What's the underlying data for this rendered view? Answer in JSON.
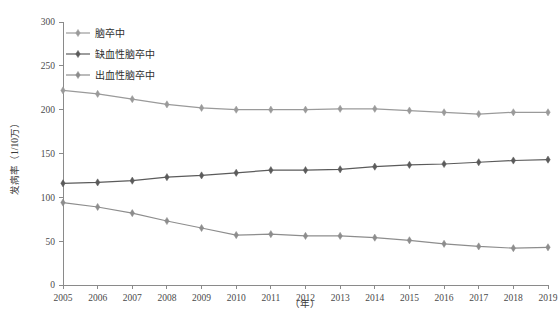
{
  "chart_data": {
    "type": "line",
    "title": "",
    "xlabel": "（年）",
    "ylabel": "发病率（1/10万）",
    "categories": [
      "2005",
      "2006",
      "2007",
      "2008",
      "2009",
      "2010",
      "2011",
      "2012",
      "2013",
      "2014",
      "2015",
      "2016",
      "2017",
      "2018",
      "2019"
    ],
    "x": [
      2005,
      2006,
      2007,
      2008,
      2009,
      2010,
      2011,
      2012,
      2013,
      2014,
      2015,
      2016,
      2017,
      2018,
      2019
    ],
    "xlim": [
      2005,
      2019
    ],
    "ylim": [
      0,
      300
    ],
    "yticks": [
      0,
      50,
      100,
      150,
      200,
      250,
      300
    ],
    "ytick_labels": [
      "0",
      "50",
      "100",
      "150",
      "200",
      "250",
      "300"
    ],
    "grid": false,
    "legend_position": "top-left",
    "marker": "diamond",
    "series": [
      {
        "name": "脑卒中",
        "color": "#9a9a9a",
        "values": [
          222,
          218,
          212,
          206,
          202,
          200,
          200,
          200,
          201,
          201,
          199,
          197,
          195,
          197,
          197
        ]
      },
      {
        "name": "缺血性脑卒中",
        "color": "#5b5b5b",
        "values": [
          116,
          117,
          119,
          123,
          125,
          128,
          131,
          131,
          132,
          135,
          137,
          138,
          140,
          142,
          143
        ]
      },
      {
        "name": "出血性脑卒中",
        "color": "#8d8d8d",
        "values": [
          94,
          89,
          82,
          73,
          65,
          57,
          58,
          56,
          56,
          54,
          51,
          47,
          44,
          42,
          43
        ]
      }
    ]
  },
  "axis": {
    "y_title": "发病率（1/10万）",
    "x_title": "（年）"
  },
  "legend": {
    "items": [
      {
        "label": "脑卒中",
        "color": "#9a9a9a"
      },
      {
        "label": "缺血性脑卒中",
        "color": "#5b5b5b"
      },
      {
        "label": "出血性脑卒中",
        "color": "#8d8d8d"
      }
    ]
  }
}
